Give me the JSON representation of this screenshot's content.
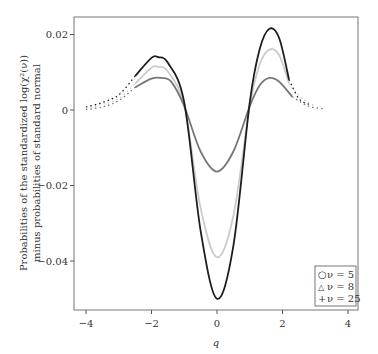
{
  "chart_data": {
    "type": "line",
    "title": "",
    "xlabel": "q",
    "ylabel_line1": "Probabilities of the standardized log(χ²(ν))",
    "ylabel_line2": "minus probabilities of standard normal",
    "xlim": [
      -4.4,
      4.3
    ],
    "ylim": [
      -0.0525,
      0.0245
    ],
    "xticks": [
      -4,
      -2,
      0,
      2,
      4
    ],
    "xtick_labels": [
      "-4",
      "-2",
      "0",
      "2",
      "4"
    ],
    "yticks": [
      0.02,
      0,
      -0.02,
      -0.04
    ],
    "ytick_labels": [
      "0.02",
      "0",
      "-0.02",
      "-0.04"
    ],
    "grid": false,
    "legend_position": "lower right",
    "series": [
      {
        "name": "ν = 5",
        "marker": "○",
        "color": "#1e1e1e",
        "x": [
          -4.0,
          -3.5,
          -3.0,
          -2.5,
          -2.0,
          -1.8,
          -1.5,
          -1.0,
          -0.5,
          0.0,
          0.5,
          1.0,
          1.3,
          1.6,
          1.9,
          2.2,
          2.5,
          2.8
        ],
        "y": [
          0.0008,
          0.002,
          0.004,
          0.009,
          0.0138,
          0.014,
          0.0125,
          0.002,
          -0.032,
          -0.05,
          -0.036,
          0.002,
          0.016,
          0.0215,
          0.019,
          0.008,
          0.003,
          0.0015
        ]
      },
      {
        "name": "ν = 8",
        "marker": "△",
        "color": "#cccccc",
        "x": [
          -4.0,
          -3.5,
          -3.0,
          -2.5,
          -2.0,
          -1.8,
          -1.5,
          -1.0,
          -0.5,
          0.0,
          0.5,
          1.0,
          1.3,
          1.6,
          1.9,
          2.2,
          2.6,
          3.0
        ],
        "y": [
          0.0004,
          0.0015,
          0.003,
          0.007,
          0.0112,
          0.0114,
          0.0102,
          0.001,
          -0.026,
          -0.039,
          -0.028,
          0.001,
          0.012,
          0.016,
          0.0145,
          0.007,
          0.003,
          0.001
        ]
      },
      {
        "name": "ν = 25",
        "marker": "+",
        "color": "#777777",
        "x": [
          -4.0,
          -3.5,
          -3.0,
          -2.5,
          -2.0,
          -1.7,
          -1.4,
          -1.0,
          -0.5,
          0.0,
          0.5,
          1.0,
          1.3,
          1.6,
          1.9,
          2.3,
          2.8,
          3.3
        ],
        "y": [
          0.0001,
          0.0008,
          0.0025,
          0.006,
          0.0083,
          0.0085,
          0.0075,
          0.001,
          -0.011,
          -0.0163,
          -0.011,
          0.001,
          0.0065,
          0.0085,
          0.0075,
          0.0035,
          0.001,
          0.0003
        ]
      }
    ]
  },
  "legend": {
    "items": [
      {
        "marker": "○",
        "label": "ν = 5",
        "color": "#1e1e1e"
      },
      {
        "marker": "△",
        "label": "ν = 8",
        "color": "#cccccc"
      },
      {
        "marker": "+",
        "label": "ν = 25",
        "color": "#777777"
      }
    ]
  }
}
